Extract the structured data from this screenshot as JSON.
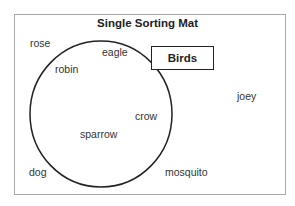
{
  "diagram": {
    "title": "Single Sorting Mat",
    "set_label": "Birds",
    "inside_items": [
      {
        "text": "eagle",
        "x": 102,
        "y": 52
      },
      {
        "text": "robin",
        "x": 55,
        "y": 69
      },
      {
        "text": "crow",
        "x": 135,
        "y": 111
      },
      {
        "text": "sparrow",
        "x": 80,
        "y": 129
      }
    ],
    "outside_items": [
      {
        "text": "rose",
        "x": 30,
        "y": 38
      },
      {
        "text": "joey",
        "x": 237,
        "y": 91
      },
      {
        "text": "dog",
        "x": 29,
        "y": 166
      },
      {
        "text": "mosquito",
        "x": 165,
        "y": 166
      }
    ],
    "colors": {
      "outline": "#222222",
      "border": "#a8a8a8",
      "text": "#333333"
    }
  }
}
